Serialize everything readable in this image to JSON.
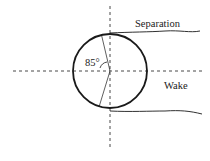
{
  "diagram": {
    "type": "flow-separation-cylinder",
    "labels": {
      "separation": "Separation",
      "wake": "Wake",
      "angle": "85°"
    },
    "geometry": {
      "circle": {
        "cx": 110,
        "cy": 71,
        "r": 37
      },
      "separation_angle_deg": 85
    },
    "colors": {
      "stroke": "#1a1a1a",
      "background": "#ffffff"
    }
  }
}
